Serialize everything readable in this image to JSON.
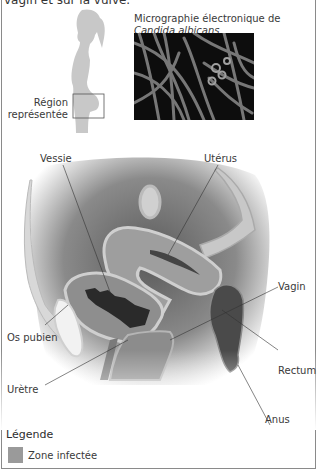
{
  "header": {
    "cut_title": "vagin et sur la vulve."
  },
  "silhouette": {
    "label_line1": "Région",
    "label_line2": "représentée"
  },
  "micrograph": {
    "caption_line1": "Micrographie électronique de",
    "caption_line2": "Candida albicans"
  },
  "anatomy": {
    "labels": {
      "vessie": "Vessie",
      "uterus": "Utérus",
      "vagin": "Vagin",
      "os_pubien": "Os pubien",
      "rectum": "Rectum",
      "uretre": "Urètre",
      "anus": "Anus"
    }
  },
  "legend": {
    "title": "Légende",
    "items": [
      {
        "label": "Zone infectée",
        "color": "#9a9a9a"
      }
    ]
  }
}
